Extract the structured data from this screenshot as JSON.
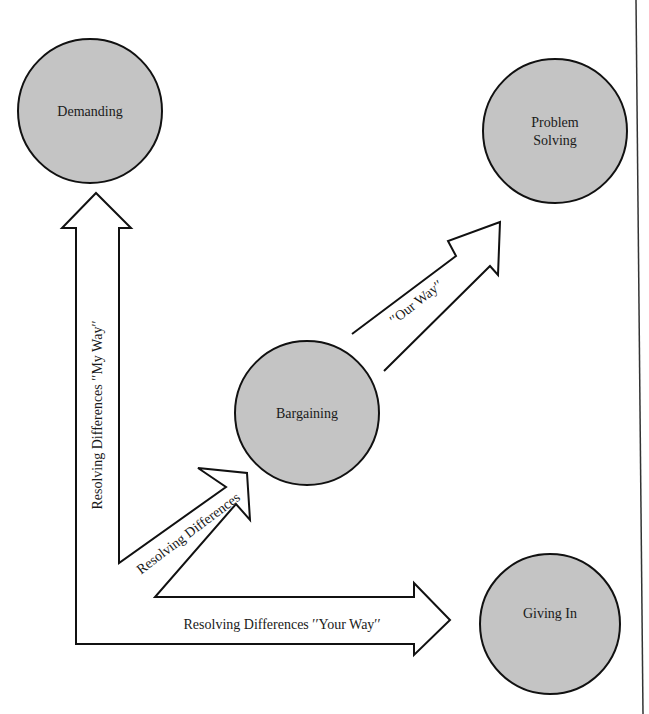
{
  "diagram": {
    "colors": {
      "node_fill": "#c4c4c4",
      "stroke": "#111111",
      "background": "#ffffff"
    },
    "nodes": {
      "demanding": {
        "label": "Demanding"
      },
      "problem_solving": {
        "label_line1": "Problem",
        "label_line2": "Solving"
      },
      "bargaining": {
        "label": "Bargaining"
      },
      "giving_in": {
        "label": "Giving In"
      }
    },
    "arrows": {
      "my_way": {
        "label": "Resolving Differences ′′My Way′′"
      },
      "resolving": {
        "label": "Resolving Differences"
      },
      "your_way": {
        "label": "Resolving Differences ′′Your Way′′"
      },
      "our_way": {
        "label": "′′Our Way′′"
      }
    }
  }
}
